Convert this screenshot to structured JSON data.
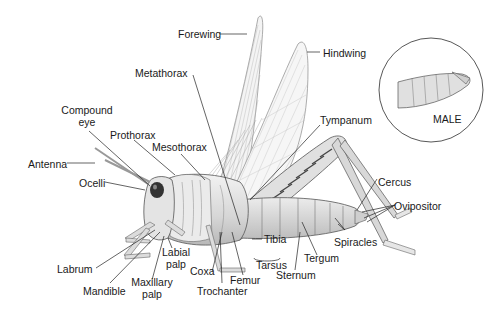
{
  "diagram": {
    "inset_label": "MALE",
    "labels": {
      "forewing": "Forewing",
      "hindwing": "Hindwing",
      "metathorax": "Metathorax",
      "compound_eye_1": "Compound",
      "compound_eye_2": "eye",
      "prothorax": "Prothorax",
      "mesothorax": "Mesothorax",
      "tympanum": "Tympanum",
      "antenna": "Antenna",
      "ocelli": "Ocelli",
      "cercus": "Cercus",
      "ovipositor": "Ovipositor",
      "tibia": "Tibia",
      "tarsus": "Tarsus",
      "spiracles": "Spiracles",
      "tergum": "Tergum",
      "sternum": "Sternum",
      "labial_palp_1": "Labial",
      "labial_palp_2": "palp",
      "coxa": "Coxa",
      "femur": "Femur",
      "trochanter": "Trochanter",
      "labrum": "Labrum",
      "mandible": "Mandible",
      "maxillary_palp_1": "Maxillary",
      "maxillary_palp_2": "palp"
    }
  }
}
